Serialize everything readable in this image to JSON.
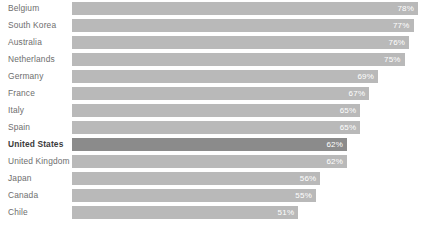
{
  "chart_data": {
    "type": "bar",
    "orientation": "horizontal",
    "title": "",
    "subtitle": "",
    "xlabel": "",
    "ylabel": "",
    "xlim": [
      0,
      78
    ],
    "grid": false,
    "legend": null,
    "value_suffix": "%",
    "value_label_position": "inside-end",
    "categories": [
      "Belgium",
      "South Korea",
      "Australia",
      "Netherlands",
      "Germany",
      "France",
      "Italy",
      "Spain",
      "United States",
      "United Kingdom",
      "Japan",
      "Canada",
      "Chile"
    ],
    "values": [
      78,
      77,
      76,
      75,
      69,
      67,
      65,
      65,
      62,
      62,
      56,
      55,
      51
    ],
    "value_labels": [
      "78%",
      "77%",
      "76%",
      "75%",
      "69%",
      "67%",
      "65%",
      "65%",
      "62%",
      "62%",
      "56%",
      "55%",
      "51%"
    ],
    "highlighted_category": "United States",
    "highlighted_index": 8,
    "bars": [
      {
        "label": "Belgium",
        "value": 78,
        "value_label": "78%",
        "highlight": false
      },
      {
        "label": "South Korea",
        "value": 77,
        "value_label": "77%",
        "highlight": false
      },
      {
        "label": "Australia",
        "value": 76,
        "value_label": "76%",
        "highlight": false
      },
      {
        "label": "Netherlands",
        "value": 75,
        "value_label": "75%",
        "highlight": false
      },
      {
        "label": "Germany",
        "value": 69,
        "value_label": "69%",
        "highlight": false
      },
      {
        "label": "France",
        "value": 67,
        "value_label": "67%",
        "highlight": false
      },
      {
        "label": "Italy",
        "value": 65,
        "value_label": "65%",
        "highlight": false
      },
      {
        "label": "Spain",
        "value": 65,
        "value_label": "65%",
        "highlight": false
      },
      {
        "label": "United States",
        "value": 62,
        "value_label": "62%",
        "highlight": true
      },
      {
        "label": "United Kingdom",
        "value": 62,
        "value_label": "62%",
        "highlight": false
      },
      {
        "label": "Japan",
        "value": 56,
        "value_label": "56%",
        "highlight": false
      },
      {
        "label": "Canada",
        "value": 55,
        "value_label": "55%",
        "highlight": false
      },
      {
        "label": "Chile",
        "value": 51,
        "value_label": "51%",
        "highlight": false
      }
    ]
  },
  "colors": {
    "background": "#ffffff",
    "bar": "#b9b9b9",
    "bar_highlight": "#8b8b8b",
    "label": "#6e6e6e",
    "label_highlight": "#3b3b3b",
    "value_label": "#ffffff"
  }
}
